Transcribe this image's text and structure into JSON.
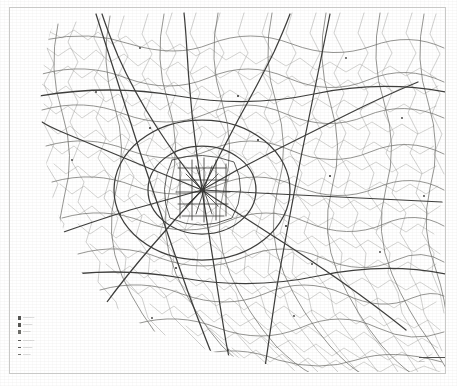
{
  "sheet": {
    "background_color": "#ffffff",
    "frame_color": "#c9c9c7",
    "width": 457,
    "height": 386
  },
  "map": {
    "title": "",
    "kind": "road-network-map",
    "style": "scanned-monochrome-line-map",
    "ink_color": "#4a4a48",
    "ink_color_light": "#8d8d89",
    "ink_color_dark": "#2e2e2c",
    "description": "Dense web of roads radiating from a central hub, thinning toward the margins; blank relief area at the upper-left corner and a diagonal uncharted edge across the lower-left."
  },
  "legend": {
    "name": "map-legend",
    "groups": [
      {
        "name": "road-classes",
        "rows": [
          {
            "swatch_color": "#555552",
            "label": "──────"
          },
          {
            "swatch_color": "#555552",
            "label": "─────"
          },
          {
            "swatch_color": "#6d6d69",
            "label": "────"
          }
        ]
      },
      {
        "name": "boundary-classes",
        "rows": [
          {
            "swatch_color": "#5a5a57",
            "label": "──────"
          },
          {
            "swatch_color": "#5a5a57",
            "label": "─────"
          },
          {
            "swatch_color": "#73736f",
            "label": "────"
          }
        ]
      }
    ]
  },
  "scale_bar": {
    "name": "scale-bar",
    "label": "——",
    "line_color": "#4f4f4d"
  }
}
